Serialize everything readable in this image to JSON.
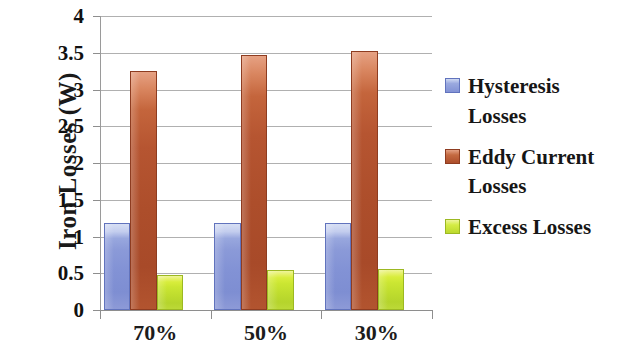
{
  "chart_data": {
    "type": "bar",
    "title": "",
    "xlabel": "",
    "ylabel": "Iron Losses (W)",
    "categories": [
      "70%",
      "50%",
      "30%"
    ],
    "series": [
      {
        "name": "Hysteresis Losses",
        "color": "#8292d5",
        "values": [
          1.18,
          1.18,
          1.19
        ]
      },
      {
        "name": "Eddy Current Losses",
        "color": "#ad4e2b",
        "values": [
          3.25,
          3.47,
          3.52
        ]
      },
      {
        "name": "Excess Losses",
        "color": "#bfdd2e",
        "values": [
          0.48,
          0.55,
          0.56
        ]
      }
    ],
    "ylim": [
      0,
      4
    ],
    "ytick_labels": [
      "0",
      "0.5",
      "1",
      "1.5",
      "2",
      "2.5",
      "3",
      "3.5",
      "4"
    ],
    "ytick_values": [
      0,
      0.5,
      1,
      1.5,
      2,
      2.5,
      3,
      3.5,
      4
    ],
    "grid": true,
    "grid_axis": "y",
    "legend_position": "right",
    "legend": [
      {
        "label_line1": "Hysteresis",
        "label_line2": "Losses",
        "color": "#8292d5"
      },
      {
        "label_line1": "Eddy Current",
        "label_line2": "Losses",
        "color": "#ad4e2b"
      },
      {
        "label_line1": "Excess Losses",
        "label_line2": "",
        "color": "#bfdd2e"
      }
    ]
  }
}
